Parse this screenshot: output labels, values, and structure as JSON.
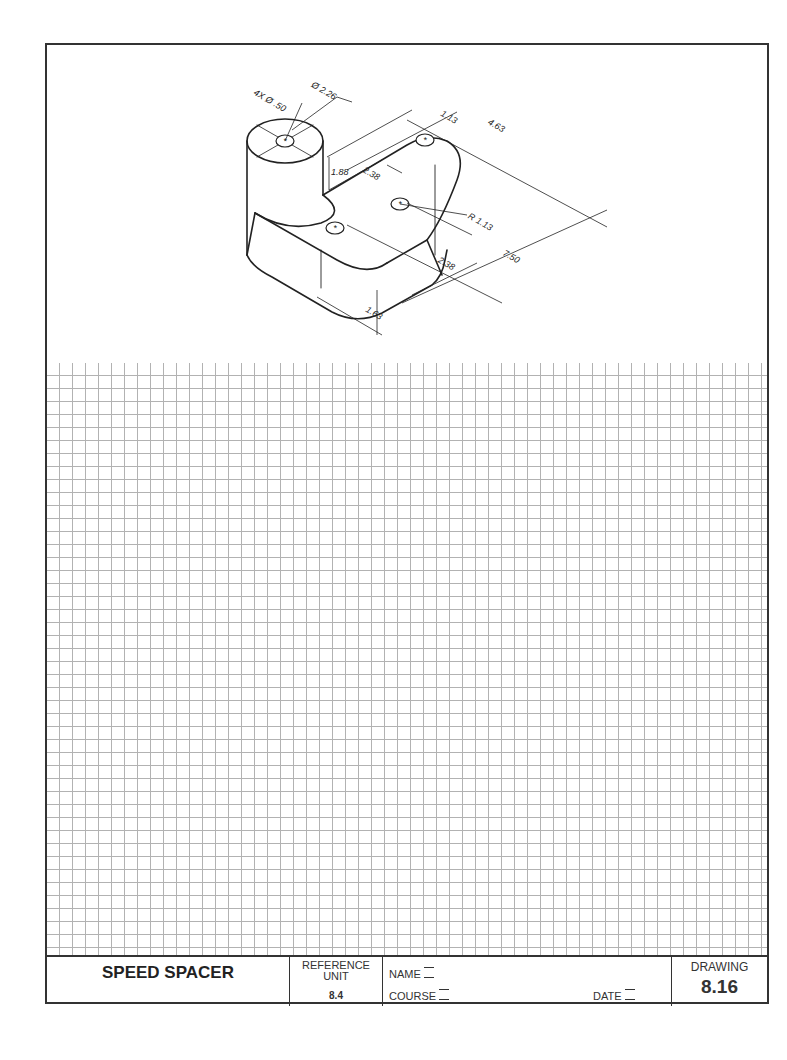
{
  "title_block": {
    "part_name": "SPEED SPACER",
    "reference_label": "REFERENCE UNIT",
    "reference_line1": "REFERENCE",
    "reference_line2": "UNIT",
    "reference_value": "8.4",
    "name_label": "NAME",
    "course_label": "COURSE",
    "date_label": "DATE",
    "drawing_label": "DRAWING",
    "drawing_number": "8.16"
  },
  "dimensions": {
    "hole_callout": "4X Ø .50",
    "boss_diameter": "Ø 2.26",
    "boss_height": "1.88",
    "edge_offset": "1.13",
    "width": "4.63",
    "hole_spacing_a": "2.38",
    "hole_spacing_b": "2.38",
    "radius": "R 1.13",
    "length": "7.50",
    "base_height": "1.63"
  },
  "colors": {
    "line": "#222222",
    "grid": "#999999",
    "border": "#333333"
  }
}
